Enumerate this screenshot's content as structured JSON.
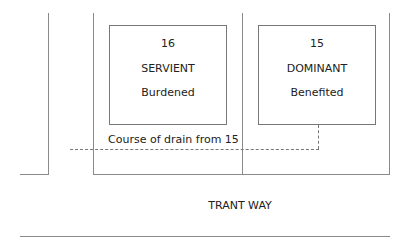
{
  "diagram": {
    "plots": [
      {
        "number": "16",
        "type": "SERVIENT",
        "status": "Burdened"
      },
      {
        "number": "15",
        "type": "DOMINANT",
        "status": "Benefited"
      }
    ],
    "drain_label": "Course of drain from 15",
    "road_label": "TRANT WAY",
    "colors": {
      "line": "#8a8a8a",
      "text": "#222222",
      "background": "#ffffff"
    }
  }
}
